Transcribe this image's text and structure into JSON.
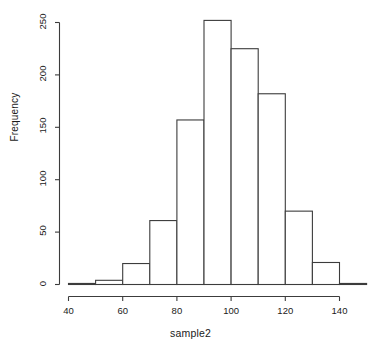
{
  "chart_data": {
    "type": "bar",
    "subtype": "histogram",
    "title": "",
    "subtitle": "",
    "xlabel": "sample2",
    "ylabel": "Frequency",
    "bin_width": 10,
    "bin_edges": [
      40,
      50,
      60,
      70,
      80,
      90,
      100,
      110,
      120,
      130,
      140,
      150
    ],
    "categories": [
      "40-50",
      "50-60",
      "60-70",
      "70-80",
      "80-90",
      "90-100",
      "100-110",
      "110-120",
      "120-130",
      "130-140",
      "140-150"
    ],
    "values": [
      1,
      4,
      20,
      61,
      157,
      252,
      225,
      182,
      70,
      21,
      1
    ],
    "xlim": [
      40,
      150
    ],
    "ylim": [
      0,
      253
    ],
    "xticks": [
      40,
      60,
      80,
      100,
      120,
      140
    ],
    "xtick_labels": [
      "40",
      "60",
      "80",
      "100",
      "120",
      "140"
    ],
    "yticks": [
      0,
      50,
      100,
      150,
      200,
      250
    ],
    "ytick_labels": [
      "0",
      "50",
      "100",
      "150",
      "200",
      "250"
    ],
    "grid": false,
    "legend": null,
    "legend_position": "none",
    "bar_fill_color": "#ffffff",
    "bar_edge_color": "#3c3c3c",
    "axis_color": "#3c3c3c",
    "background_color": "#ffffff",
    "annotations": []
  }
}
